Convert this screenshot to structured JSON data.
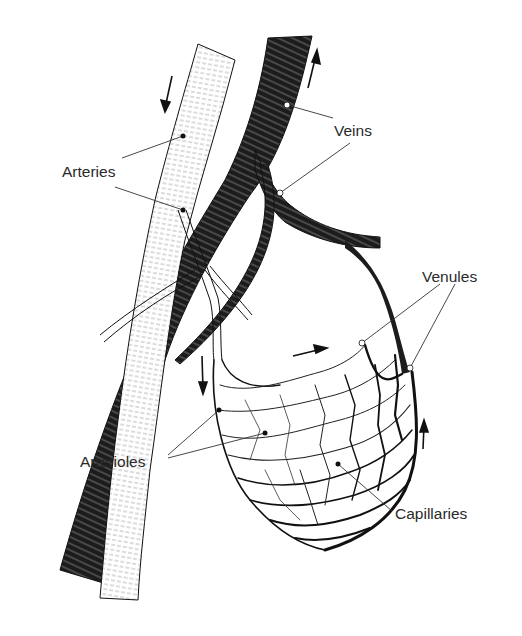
{
  "figure": {
    "labels": {
      "arteries": "Arteries",
      "veins": "Veins",
      "venules": "Venules",
      "arterioles": "Arterioles",
      "capillaries": "Capillaries"
    },
    "flow_arrows": [
      {
        "location": "artery top",
        "direction": "down"
      },
      {
        "location": "vein top",
        "direction": "up"
      },
      {
        "location": "arteriole left",
        "direction": "down"
      },
      {
        "location": "capillary bed middle",
        "direction": "right"
      },
      {
        "location": "venule right",
        "direction": "up"
      }
    ],
    "colors": {
      "ink": "#1a1a1a",
      "artery_fill": "#ffffff",
      "vein_fill": "#1c1c1c",
      "background": "#ffffff"
    }
  }
}
